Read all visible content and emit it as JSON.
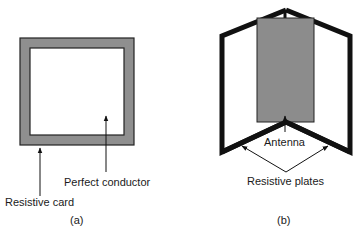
{
  "figure_a": {
    "caption": "(a)",
    "labels": {
      "resistive_card": "Resistive card",
      "perfect_conductor": "Perfect conductor"
    }
  },
  "figure_b": {
    "caption": "(b)",
    "labels": {
      "antenna": "Antenna",
      "resistive_plates": "Resistive plates"
    }
  },
  "colors": {
    "resistive_fill": "#8f8f8f",
    "outline": "#111111",
    "antenna_fill": "#8c8c8c",
    "background": "#ffffff"
  }
}
